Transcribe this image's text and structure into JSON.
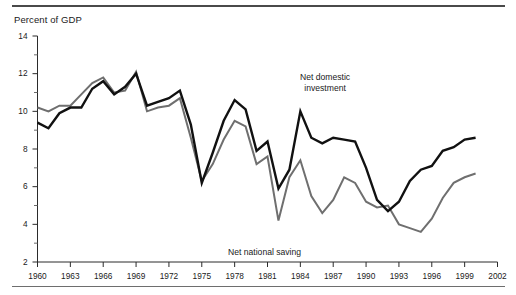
{
  "chart_data": {
    "type": "line",
    "title": "",
    "ylabel": "Percent of GDP",
    "xlabel": "",
    "ylim": [
      2,
      14
    ],
    "xlim": [
      1960,
      2002
    ],
    "grid": false,
    "legend_position": "inline-annotations",
    "y_ticks": [
      2,
      4,
      6,
      8,
      10,
      12,
      14
    ],
    "y_minor_ticks": [
      3,
      5,
      7,
      9,
      11,
      13
    ],
    "x_ticks": [
      1960,
      1963,
      1966,
      1969,
      1972,
      1975,
      1978,
      1981,
      1984,
      1987,
      1990,
      1993,
      1996,
      1999,
      2002
    ],
    "x": [
      1960,
      1961,
      1962,
      1963,
      1964,
      1965,
      1966,
      1967,
      1968,
      1969,
      1970,
      1971,
      1972,
      1973,
      1974,
      1975,
      1976,
      1977,
      1978,
      1979,
      1980,
      1981,
      1982,
      1983,
      1984,
      1985,
      1986,
      1987,
      1988,
      1989,
      1990,
      1991,
      1992,
      1993,
      1994,
      1995,
      1996,
      1997,
      1998,
      1999,
      2000
    ],
    "series": [
      {
        "name": "Net domestic investment",
        "color": "#111111",
        "values": [
          9.4,
          9.1,
          9.9,
          10.2,
          10.2,
          11.2,
          11.6,
          10.9,
          11.3,
          12.0,
          10.3,
          10.5,
          10.7,
          11.1,
          9.3,
          6.2,
          7.8,
          9.5,
          10.6,
          10.1,
          7.9,
          8.4,
          5.9,
          6.9,
          10.0,
          8.6,
          8.3,
          8.6,
          8.5,
          8.4,
          7.0,
          5.3,
          4.7,
          5.2,
          6.3,
          6.9,
          7.1,
          7.9,
          8.1,
          8.5,
          8.6
        ],
        "line_width": 2.4
      },
      {
        "name": "Net national saving",
        "color": "#6f6f6f",
        "values": [
          10.2,
          10.0,
          10.3,
          10.3,
          10.9,
          11.5,
          11.8,
          11.0,
          11.1,
          12.1,
          10.0,
          10.2,
          10.3,
          10.7,
          8.6,
          6.3,
          7.2,
          8.5,
          9.5,
          9.2,
          7.2,
          7.6,
          4.2,
          6.5,
          7.4,
          5.5,
          4.6,
          5.3,
          6.5,
          6.2,
          5.2,
          4.9,
          5.0,
          4.0,
          3.8,
          3.6,
          4.3,
          5.4,
          6.2,
          6.5,
          6.7
        ],
        "line_width": 2.0
      }
    ],
    "annotations": [
      {
        "id": "investment",
        "text_line1": "Net domestic",
        "text_line2": "investment",
        "points_to": {
          "x": 1984,
          "y": 10.0
        }
      },
      {
        "id": "saving",
        "text_line1": "Net national saving",
        "text_line2": "",
        "points_to": {
          "x": 1986,
          "y": 4.6
        }
      }
    ]
  }
}
